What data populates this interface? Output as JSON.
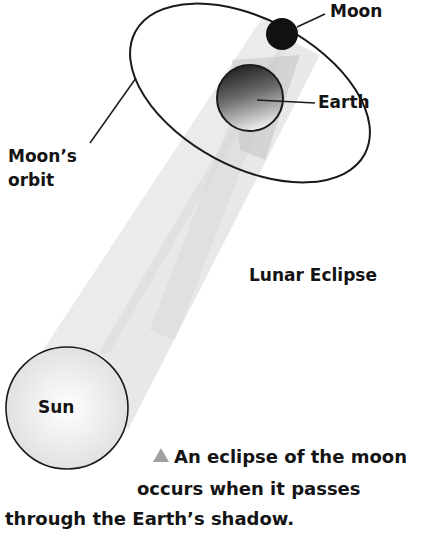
{
  "diagram": {
    "title": "Lunar Eclipse",
    "labels": {
      "moon": "Moon",
      "earth": "Earth",
      "moons_orbit_line1": "Moon’s",
      "moons_orbit_line2": "orbit",
      "sun": "Sun"
    },
    "caption": {
      "marker": "triangle-up-icon",
      "line1": "An eclipse of the moon",
      "line2": "occurs when it passes",
      "line3": "through the Earth’s shadow."
    },
    "bodies": [
      {
        "name": "Sun",
        "cx": 67,
        "cy": 408,
        "r": 61,
        "fill": "#f0f0f0"
      },
      {
        "name": "Earth",
        "cx": 250,
        "cy": 98,
        "r": 33,
        "fill": "gradient-dark-top"
      },
      {
        "name": "Moon",
        "cx": 282,
        "cy": 34,
        "r": 16,
        "fill": "#111111"
      }
    ],
    "colors": {
      "stroke": "#1a1a1a",
      "beam": "#d8d8d8",
      "marker": "#a0a0a0"
    }
  }
}
